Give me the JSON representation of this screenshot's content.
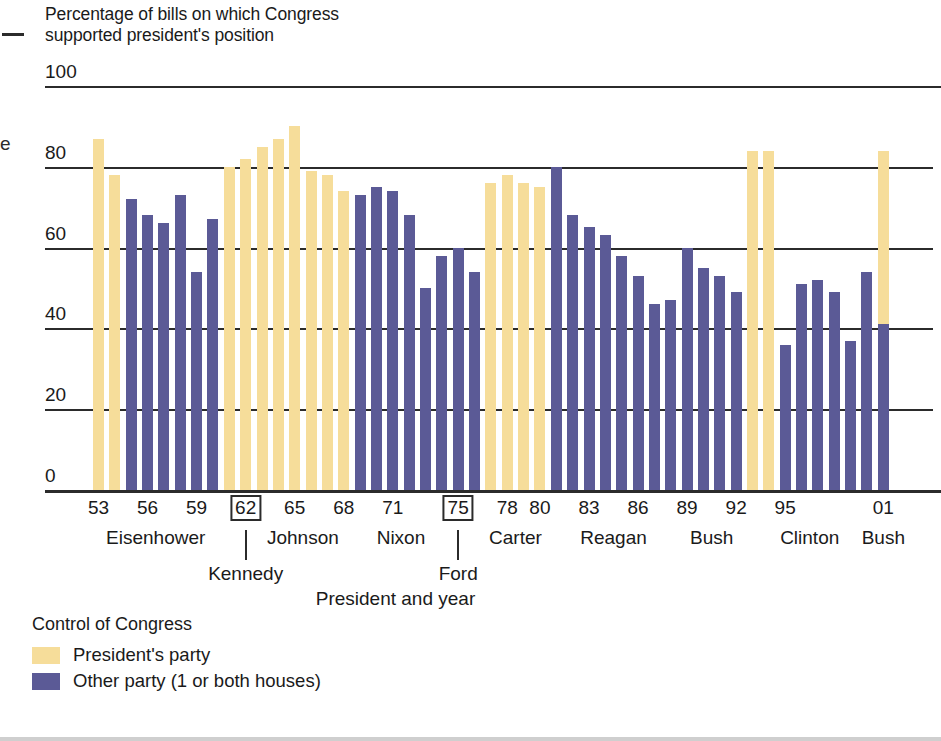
{
  "chart_data": {
    "type": "bar",
    "title": "Percentage of bills on which Congress\nsupported president's position",
    "xlabel": "President and year",
    "ylabel": "",
    "ylim": [
      0,
      100
    ],
    "yticks": [
      0,
      20,
      40,
      60,
      80,
      100
    ],
    "grid": true,
    "legend_position": "below-left",
    "legend_title": "Control of Congress",
    "series": [
      {
        "name": "President's party",
        "color": "#f6dd9a"
      },
      {
        "name": "Other party (1 or both houses)",
        "color": "#5b5a96"
      }
    ],
    "categories": [
      "1953",
      "1954",
      "1955",
      "1956",
      "1957",
      "1958",
      "1959",
      "1960",
      "1961",
      "1962",
      "1963",
      "1964",
      "1965",
      "1966",
      "1967",
      "1968",
      "1969",
      "1970",
      "1971",
      "1972",
      "1973",
      "1974",
      "1975",
      "1976",
      "1977",
      "1978",
      "1979",
      "1980",
      "1981",
      "1982",
      "1983",
      "1984",
      "1985",
      "1986",
      "1987",
      "1988",
      "1989",
      "1990",
      "1991",
      "1992",
      "1993",
      "1994",
      "1995",
      "1996",
      "1997",
      "1998",
      "1999",
      "2000",
      "2001"
    ],
    "values": [
      87,
      78,
      72,
      68,
      66,
      73,
      54,
      67,
      80,
      82,
      85,
      87,
      90,
      79,
      78,
      74,
      73,
      75,
      74,
      68,
      50,
      58,
      60,
      54,
      76,
      78,
      76,
      75,
      80,
      68,
      65,
      63,
      58,
      53,
      46,
      47,
      60,
      55,
      53,
      49,
      84,
      84,
      36,
      51,
      52,
      49,
      37,
      54,
      84
    ],
    "bar_parties": [
      "president",
      "president",
      "other",
      "other",
      "other",
      "other",
      "other",
      "other",
      "president",
      "president",
      "president",
      "president",
      "president",
      "president",
      "president",
      "president",
      "other",
      "other",
      "other",
      "other",
      "other",
      "other",
      "other",
      "other",
      "president",
      "president",
      "president",
      "president",
      "other",
      "other",
      "other",
      "other",
      "other",
      "other",
      "other",
      "other",
      "other",
      "other",
      "other",
      "other",
      "president",
      "president",
      "other",
      "other",
      "other",
      "other",
      "other",
      "other",
      "split"
    ],
    "split_bar": {
      "category": "2001",
      "other_to": 41,
      "president_to": 84
    },
    "xtick_labels": [
      {
        "label": "53",
        "year": 1953,
        "boxed": false
      },
      {
        "label": "56",
        "year": 1956,
        "boxed": false
      },
      {
        "label": "59",
        "year": 1959,
        "boxed": false
      },
      {
        "label": "62",
        "year": 1962,
        "boxed": true
      },
      {
        "label": "65",
        "year": 1965,
        "boxed": false
      },
      {
        "label": "68",
        "year": 1968,
        "boxed": false
      },
      {
        "label": "71",
        "year": 1971,
        "boxed": false
      },
      {
        "label": "75",
        "year": 1975,
        "boxed": true
      },
      {
        "label": "78",
        "year": 1978,
        "boxed": false
      },
      {
        "label": "80",
        "year": 1980,
        "boxed": false
      },
      {
        "label": "83",
        "year": 1983,
        "boxed": false
      },
      {
        "label": "86",
        "year": 1986,
        "boxed": false
      },
      {
        "label": "89",
        "year": 1989,
        "boxed": false
      },
      {
        "label": "92",
        "year": 1992,
        "boxed": false
      },
      {
        "label": "95",
        "year": 1995,
        "boxed": false
      },
      {
        "label": "01",
        "year": 2001,
        "boxed": false
      }
    ],
    "presidents": [
      {
        "name": "Eisenhower",
        "center_year": 1956.5,
        "row": 1
      },
      {
        "name": "Kennedy",
        "center_year": 1962.0,
        "row": 2
      },
      {
        "name": "Johnson",
        "center_year": 1965.5,
        "row": 1
      },
      {
        "name": "Nixon",
        "center_year": 1971.5,
        "row": 1
      },
      {
        "name": "Ford",
        "center_year": 1975.0,
        "row": 2
      },
      {
        "name": "Carter",
        "center_year": 1978.5,
        "row": 1
      },
      {
        "name": "Reagan",
        "center_year": 1984.5,
        "row": 1
      },
      {
        "name": "Bush",
        "center_year": 1990.5,
        "row": 1
      },
      {
        "name": "Clinton",
        "center_year": 1996.5,
        "row": 1
      },
      {
        "name": "Bush",
        "center_year": 2001.0,
        "row": 1
      }
    ]
  },
  "title": "Percentage of bills on which Congress\nsupported president's position",
  "axis_caption": "President and year",
  "legend": {
    "title": "Control of Congress",
    "items": [
      {
        "label": "President's party",
        "color": "#f6dd9a"
      },
      {
        "label": "Other party (1 or both houses)",
        "color": "#5b5a96"
      }
    ]
  },
  "edge_artifacts": {
    "letter": "e"
  }
}
